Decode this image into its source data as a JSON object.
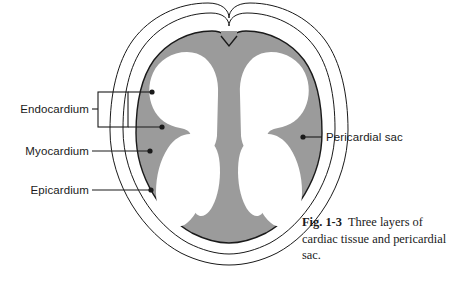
{
  "figure": {
    "colors": {
      "myocardium_fill": "#9b9b9b",
      "chamber_fill": "#ffffff",
      "outline": "#1a1a1a",
      "background": "#ffffff"
    },
    "labels": [
      {
        "id": "endocardium",
        "text": "Endocardium",
        "side": "left"
      },
      {
        "id": "myocardium",
        "text": "Myocardium",
        "side": "left"
      },
      {
        "id": "epicardium",
        "text": "Epicardium",
        "side": "left"
      },
      {
        "id": "pericardial-sac",
        "text": "Pericardial sac",
        "side": "right"
      }
    ]
  },
  "caption": {
    "figure_number": "Fig. 1-3",
    "body": "Three layers of cardiac tissue and pericardial sac."
  }
}
